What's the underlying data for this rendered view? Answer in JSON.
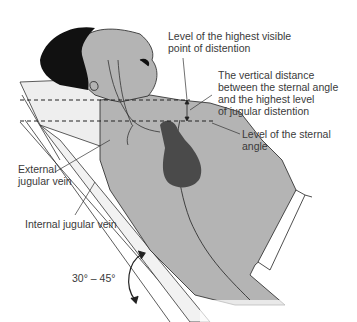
{
  "figure": {
    "labels": {
      "highest_point": "Level of the highest visible\npoint of distention",
      "vertical_distance": "The vertical distance\nbetween the sternal angle\nand the highest level\nof jugular distention",
      "sternal_angle": "Level of the sternal\nangle",
      "external_jugular": "External\njugular vein",
      "internal_jugular": "Internal jugular vein",
      "angle_range": "30° – 45°"
    },
    "colors": {
      "skin": "#b4b4b4",
      "hair": "#111111",
      "heart": "#4a4a4a",
      "pillow": "#ececec",
      "line": "#222222",
      "text": "#3a3a3a"
    }
  }
}
